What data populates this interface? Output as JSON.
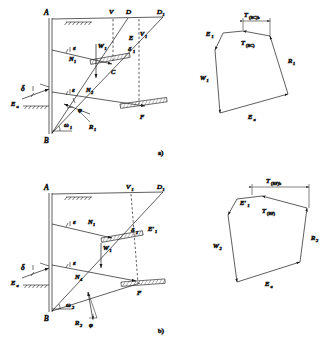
{
  "figure": {
    "type": "engineering-diagram",
    "panels": [
      {
        "id": "a",
        "caption": "a)",
        "wall_labels": [
          "A",
          "B"
        ],
        "surface_labels": [
          "V",
          "D",
          "D1"
        ],
        "wedge_labels": [
          "E",
          "V1",
          "C",
          "F"
        ],
        "force_labels": [
          "ε",
          "N1",
          "W1",
          "ε",
          "N2",
          "δ",
          "Ea",
          "δ₁",
          "ω₁",
          "φ",
          "R₁"
        ],
        "polygon": {
          "title_top": "T(BC)b",
          "inner": "T(BC)",
          "vectors": [
            "E₁",
            "W₁",
            "Ea",
            "R₁"
          ]
        }
      },
      {
        "id": "b",
        "caption": "b)",
        "wall_labels": [
          "A",
          "B"
        ],
        "surface_labels": [
          "V1",
          "D1"
        ],
        "wedge_labels": [
          "E'1",
          "F"
        ],
        "force_labels": [
          "ε",
          "N1",
          "W1",
          "ε",
          "N4",
          "δ",
          "Ea",
          "δ₁",
          "ω₂",
          "R₂",
          "φ"
        ],
        "polygon": {
          "title_top": "T(BF)b",
          "inner": "T(BF)",
          "vectors": [
            "E'₁",
            "W₂",
            "Ea",
            "R₂"
          ]
        }
      }
    ],
    "colors": {
      "line": "#1a1a1a",
      "hatch": "#555555",
      "background": "#ffffff"
    }
  },
  "panel_a": {
    "caption": "a)",
    "A": "A",
    "B": "B",
    "V": "V",
    "D": "D",
    "D1": "D",
    "D1sub": "1",
    "E": "E",
    "V1": "V",
    "V1sub": "1",
    "C": "C",
    "F": "F",
    "eps1": "ε",
    "eps2": "ε",
    "N1": "N",
    "N1sub": "1",
    "N2": "N",
    "N2sub": "2",
    "W1": "W",
    "W1sub": "1",
    "delta": "δ",
    "delta1": "δ",
    "delta1sub": "1",
    "Ea": "E",
    "Easub": "a",
    "omega1": "ω",
    "omega1sub": "1",
    "phi": "φ",
    "R1": "R",
    "R1sub": "1"
  },
  "poly_a": {
    "T_top": "T",
    "T_top_sub": "(BC)b",
    "T_in": "T",
    "T_in_sub": "(BC)",
    "E1": "E",
    "E1sub": "1",
    "W1": "W",
    "W1sub": "1",
    "Ea": "E",
    "Easub": "a",
    "R1": "R",
    "R1sub": "1"
  },
  "panel_b": {
    "caption": "b)",
    "A": "A",
    "B": "B",
    "V1": "V",
    "V1sub": "1",
    "D1": "D",
    "D1sub": "1",
    "Ep1": "E′",
    "Ep1sub": "1",
    "F": "F",
    "eps1": "ε",
    "eps2": "ε",
    "N1": "N",
    "N1sub": "1",
    "N4": "N",
    "N4sub": "4",
    "W1": "W",
    "W1sub": "1",
    "delta": "δ",
    "delta1": "δ",
    "delta1sub": "1",
    "Ea": "E",
    "Easub": "a",
    "omega2": "ω",
    "omega2sub": "2",
    "R2": "R",
    "R2sub": "2",
    "phi": "φ"
  },
  "poly_b": {
    "T_top": "T",
    "T_top_sub": "(BF)b",
    "T_in": "T",
    "T_in_sub": "(BF)",
    "Ep1": "E′",
    "Ep1sub": "1",
    "W2": "W",
    "W2sub": "2",
    "Ea": "E",
    "Easub": "a",
    "R2": "R",
    "R2sub": "2"
  },
  "footer": {
    "text": ""
  }
}
